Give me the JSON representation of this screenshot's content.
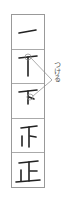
{
  "diagram": {
    "character": "正",
    "steps": [
      {
        "index": 1,
        "glyph": "一"
      },
      {
        "index": 2,
        "glyph": "丅"
      },
      {
        "index": 3,
        "glyph": "下"
      },
      {
        "index": 4,
        "glyph": "𠃍"
      },
      {
        "index": 5,
        "glyph": "正"
      }
    ],
    "annotation": {
      "text": "つける",
      "targets": [
        2,
        3
      ]
    },
    "colors": {
      "stroke": "#222222",
      "border": "#999999",
      "annotation": "#888888"
    }
  }
}
